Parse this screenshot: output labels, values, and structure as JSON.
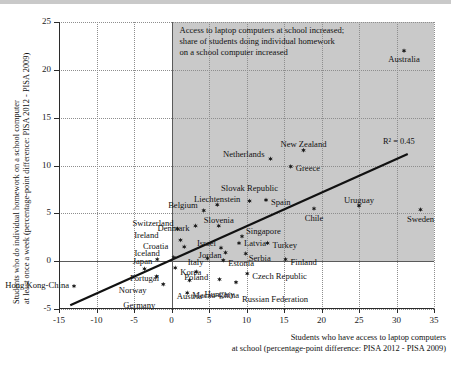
{
  "axes": {
    "y_title": "Students who do individual homework on a school computer\nat least once a week (percentage-point difference: PISA 2012 - PISA 2009)",
    "x_title": "Students who have access to laptop computers\nat school (percentage-point difference: PISA 2012 - PISA 2009)",
    "y_ticks": [
      "25",
      "20",
      "15",
      "10",
      "5",
      "0",
      "-5"
    ],
    "x_ticks": [
      "-15",
      "-10",
      "-5",
      "0",
      "5",
      "10",
      "15",
      "20",
      "25",
      "30",
      "35"
    ]
  },
  "annotation": "Access to laptop computers at school increased;\nshare of students doing individual homework\non a school computer increased",
  "r2_label": "R² = 0.45",
  "colors": {
    "marker": "#1a1a1a",
    "shade": "#c9c9c9",
    "grid": "#8e8e8e",
    "trend": "#111111"
  },
  "chart_data": {
    "type": "scatter",
    "title": "",
    "xlabel": "Students who have access to laptop computers at school (percentage-point difference: PISA 2012 - PISA 2009)",
    "ylabel": "Students who do individual homework on a school computer at least once a week (percentage-point difference: PISA 2012 - PISA 2009)",
    "xlim": [
      -15,
      35
    ],
    "ylim": [
      -5,
      25
    ],
    "xticks": [
      -15,
      -10,
      -5,
      0,
      5,
      10,
      15,
      20,
      25,
      30,
      35
    ],
    "yticks": [
      -5,
      0,
      5,
      10,
      15,
      20,
      25
    ],
    "grid": true,
    "legend": false,
    "r_squared": 0.45,
    "trendline": {
      "x0": -13.5,
      "y0": -4.6,
      "x1": 31.5,
      "y1": 11.2
    },
    "shaded_quadrant": {
      "x_from": 0,
      "x_to": 35,
      "y_from": 0,
      "y_to": 25
    },
    "points": [
      {
        "name": "Australia",
        "x": 31.0,
        "y": 22.0,
        "label_dx": 0,
        "label_dy": 9,
        "align": "center"
      },
      {
        "name": "Sweden",
        "x": 33.2,
        "y": 5.4,
        "label_dx": 0,
        "label_dy": 10,
        "align": "center"
      },
      {
        "name": "New Zealand",
        "x": 17.6,
        "y": 11.6,
        "label_dx": 0,
        "label_dy": -5,
        "align": "center"
      },
      {
        "name": "Netherlands",
        "x": 13.2,
        "y": 10.7,
        "label_dx": -6,
        "label_dy": -4,
        "align": "right"
      },
      {
        "name": "Greece",
        "x": 15.9,
        "y": 9.9,
        "label_dx": 5,
        "label_dy": 3,
        "align": "left"
      },
      {
        "name": "Uruguay",
        "x": 25.0,
        "y": 5.8,
        "label_dx": 0,
        "label_dy": -5,
        "align": "center"
      },
      {
        "name": "Chile",
        "x": 19.0,
        "y": 5.5,
        "label_dx": 0,
        "label_dy": 10,
        "align": "center"
      },
      {
        "name": "Slovak Republic",
        "x": 10.4,
        "y": 6.3,
        "label_dx": 0,
        "label_dy": -12,
        "align": "center"
      },
      {
        "name": "Spain",
        "x": 12.6,
        "y": 6.4,
        "label_dx": 5,
        "label_dy": 3,
        "align": "left"
      },
      {
        "name": "Liechtenstein",
        "x": 6.1,
        "y": 5.9,
        "label_dx": 0,
        "label_dy": -5,
        "align": "center"
      },
      {
        "name": "Belgium",
        "x": 4.3,
        "y": 5.3,
        "label_dx": -6,
        "label_dy": -4,
        "align": "right"
      },
      {
        "name": "Denmark",
        "x": 3.2,
        "y": 3.7,
        "label_dx": -6,
        "label_dy": 3,
        "align": "right"
      },
      {
        "name": "Slovenia",
        "x": 6.3,
        "y": 3.7,
        "label_dx": 0,
        "label_dy": -5,
        "align": "center"
      },
      {
        "name": "Switzerland",
        "x": 0.8,
        "y": 3.4,
        "label_dx": -4,
        "label_dy": -5,
        "align": "right"
      },
      {
        "name": "Singapore",
        "x": 9.4,
        "y": 2.6,
        "label_dx": 4,
        "label_dy": -4,
        "align": "left"
      },
      {
        "name": "Latvia",
        "x": 9.0,
        "y": 1.9,
        "label_dx": 5,
        "label_dy": 1,
        "align": "left"
      },
      {
        "name": "Turkey",
        "x": 12.8,
        "y": 1.9,
        "label_dx": 5,
        "label_dy": 3,
        "align": "left"
      },
      {
        "name": "Ireland",
        "x": 1.2,
        "y": 2.2,
        "label_dx": -22,
        "label_dy": -4,
        "align": "right"
      },
      {
        "name": "Croatia",
        "x": 1.7,
        "y": 1.5,
        "label_dx": -16,
        "label_dy": 0,
        "align": "right"
      },
      {
        "name": "Israel",
        "x": 6.6,
        "y": 1.4,
        "label_dx": -5,
        "label_dy": -4,
        "align": "right"
      },
      {
        "name": "Jordan",
        "x": 7.2,
        "y": 0.9,
        "label_dx": -4,
        "label_dy": 3,
        "align": "right"
      },
      {
        "name": "Serbia",
        "x": 9.9,
        "y": 0.8,
        "label_dx": 3,
        "label_dy": 5,
        "align": "left"
      },
      {
        "name": "Iceland",
        "x": 0.3,
        "y": 0.4,
        "label_dx": -14,
        "label_dy": -3,
        "align": "right"
      },
      {
        "name": "Japan",
        "x": -1.9,
        "y": 0.2,
        "label_dx": -5,
        "label_dy": 3,
        "align": "right"
      },
      {
        "name": "Italy",
        "x": 4.8,
        "y": 0.3,
        "label_dx": -4,
        "label_dy": 5,
        "align": "right"
      },
      {
        "name": "Estonia",
        "x": 6.9,
        "y": 0.1,
        "label_dx": 5,
        "label_dy": 4,
        "align": "left"
      },
      {
        "name": "Finland",
        "x": 15.2,
        "y": 0.2,
        "label_dx": 5,
        "label_dy": 4,
        "align": "left"
      },
      {
        "name": "Korea",
        "x": 0.5,
        "y": -0.7,
        "label_dx": 5,
        "label_dy": 5,
        "align": "left"
      },
      {
        "name": "Poland",
        "x": 3.3,
        "y": -1.1,
        "label_dx": 0,
        "label_dy": 6,
        "align": "center"
      },
      {
        "name": "Czech Republic",
        "x": 10.1,
        "y": -1.3,
        "label_dx": 5,
        "label_dy": 3,
        "align": "left"
      },
      {
        "name": "Portugal",
        "x": -3.6,
        "y": -0.8,
        "label_dx": 0,
        "label_dy": 10,
        "align": "center"
      },
      {
        "name": "Norway",
        "x": -2.0,
        "y": -1.6,
        "label_dx": -10,
        "label_dy": 15,
        "align": "right"
      },
      {
        "name": "Germany",
        "x": -1.1,
        "y": -2.4,
        "label_dx": -8,
        "label_dy": 22,
        "align": "right"
      },
      {
        "name": "Austria",
        "x": 2.4,
        "y": -2.0,
        "label_dx": 0,
        "label_dy": 17,
        "align": "center"
      },
      {
        "name": "Hungary",
        "x": 6.4,
        "y": -1.9,
        "label_dx": 0,
        "label_dy": 16,
        "align": "center"
      },
      {
        "name": "Russian Federation",
        "x": 8.6,
        "y": -2.2,
        "label_dx": 6,
        "label_dy": 18,
        "align": "left"
      },
      {
        "name": "Macao-China",
        "x": 2.1,
        "y": -3.3,
        "label_dx": 5,
        "label_dy": 3,
        "align": "left"
      },
      {
        "name": "Hong Kong-China",
        "x": -13.0,
        "y": -2.6,
        "label_dx": -5,
        "label_dy": 0,
        "align": "right"
      }
    ]
  }
}
